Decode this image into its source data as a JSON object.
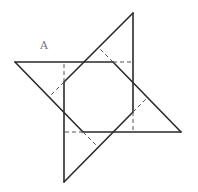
{
  "diagram": {
    "type": "geometry-figure",
    "labels": [
      {
        "text": "A",
        "x": 40,
        "y": 49
      }
    ],
    "colors": {
      "solid": "#2a2a2a",
      "dashed": "#555555",
      "label": "#777777",
      "background": "#ffffff"
    },
    "solid_lines": [
      [
        15,
        62,
        113,
        62
      ],
      [
        15,
        62,
        83,
        132
      ],
      [
        133,
        13,
        133,
        112
      ],
      [
        133,
        13,
        64,
        82
      ],
      [
        181,
        132,
        83,
        132
      ],
      [
        181,
        132,
        113,
        62
      ],
      [
        64,
        182,
        64,
        82
      ],
      [
        64,
        182,
        133,
        112
      ]
    ],
    "dashed_lines": [
      [
        113,
        62,
        133,
        62
      ],
      [
        133,
        112,
        133,
        132
      ],
      [
        83,
        132,
        64,
        132
      ],
      [
        64,
        82,
        64,
        62
      ],
      [
        64,
        82,
        50,
        96
      ],
      [
        83,
        132,
        97,
        146
      ],
      [
        113,
        62,
        99,
        48
      ],
      [
        133,
        112,
        147,
        98
      ]
    ]
  }
}
